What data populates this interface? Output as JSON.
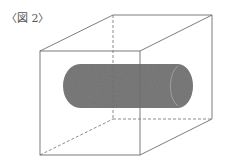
{
  "figure": {
    "caption": "〈図 2〉",
    "colors": {
      "background": "#ffffff",
      "edge": "#6e6e6e",
      "cylinder_fill": "#7c7c7c",
      "cylinder_cap_outline": "#a8a8a8"
    },
    "cube": {
      "front_top_left": [
        40,
        51
      ],
      "front_top_right": [
        140,
        51
      ],
      "front_bottom_left": [
        40,
        155
      ],
      "front_bottom_right": [
        140,
        155
      ],
      "back_top_left": [
        113,
        15
      ],
      "back_top_right": [
        212,
        15
      ],
      "back_bottom_left": [
        113,
        119
      ],
      "back_bottom_right": [
        212,
        119
      ]
    },
    "cylinder": {
      "x_left": 63,
      "x_right": 193,
      "y_top": 64,
      "y_bottom": 108
    }
  }
}
